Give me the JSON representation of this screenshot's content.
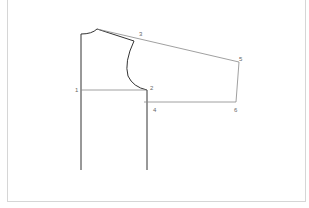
{
  "diagram": {
    "type": "sleeve-bodice-pattern-draft",
    "stroke_dark": "#333333",
    "stroke_light": "#888888",
    "points": [
      {
        "id": "1",
        "label": "1",
        "x": 76,
        "y": 91
      },
      {
        "id": "2",
        "label": "2",
        "x": 151,
        "y": 88
      },
      {
        "id": "3",
        "label": "3",
        "x": 141,
        "y": 34
      },
      {
        "id": "4",
        "label": "4",
        "x": 154,
        "y": 110
      },
      {
        "id": "5",
        "label": "5",
        "x": 241,
        "y": 59
      },
      {
        "id": "6",
        "label": "6",
        "x": 235,
        "y": 111
      }
    ]
  }
}
